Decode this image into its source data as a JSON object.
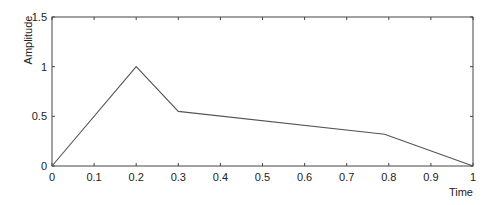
{
  "chart_data": {
    "type": "line",
    "title": "",
    "xlabel": "Time",
    "ylabel": "Amplitude",
    "xlim": [
      0,
      1
    ],
    "ylim": [
      0,
      1.5
    ],
    "grid": false,
    "xticks": [
      0,
      0.1,
      0.2,
      0.3,
      0.4,
      0.5,
      0.6,
      0.7,
      0.8,
      0.9,
      1
    ],
    "xtick_labels": [
      "0",
      "0.1",
      "0.2",
      "0.3",
      "0.4",
      "0.5",
      "0.6",
      "0.7",
      "0.8",
      "0.9",
      "1"
    ],
    "yticks": [
      0,
      0.5,
      1,
      1.5
    ],
    "ytick_labels": [
      "0",
      "0.5",
      "1",
      "1.5"
    ],
    "series": [
      {
        "name": "amplitude",
        "x": [
          0,
          0.2,
          0.3,
          0.79,
          1
        ],
        "y": [
          0,
          1.0,
          0.55,
          0.32,
          0
        ],
        "color": "#555555"
      }
    ]
  }
}
